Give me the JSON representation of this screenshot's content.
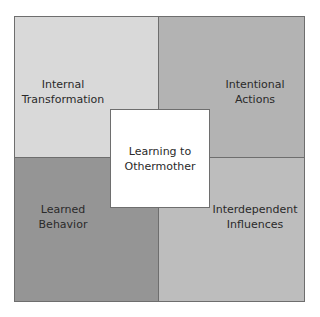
{
  "diagram": {
    "center": {
      "label": "Learning to\nOthermother",
      "color": "#ffffff"
    },
    "quadrants": [
      {
        "position": "top-left",
        "label": "Internal\nTransformation",
        "color": "#d9d9d9"
      },
      {
        "position": "top-right",
        "label": "Intentional\nActions",
        "color": "#b3b3b3"
      },
      {
        "position": "bottom-left",
        "label": "Learned\nBehavior",
        "color": "#959595"
      },
      {
        "position": "bottom-right",
        "label": "Interdependent\nInfluences",
        "color": "#bdbdbd"
      }
    ],
    "border_color": "#6e6e6e",
    "text_color": "#2a2a2a"
  }
}
